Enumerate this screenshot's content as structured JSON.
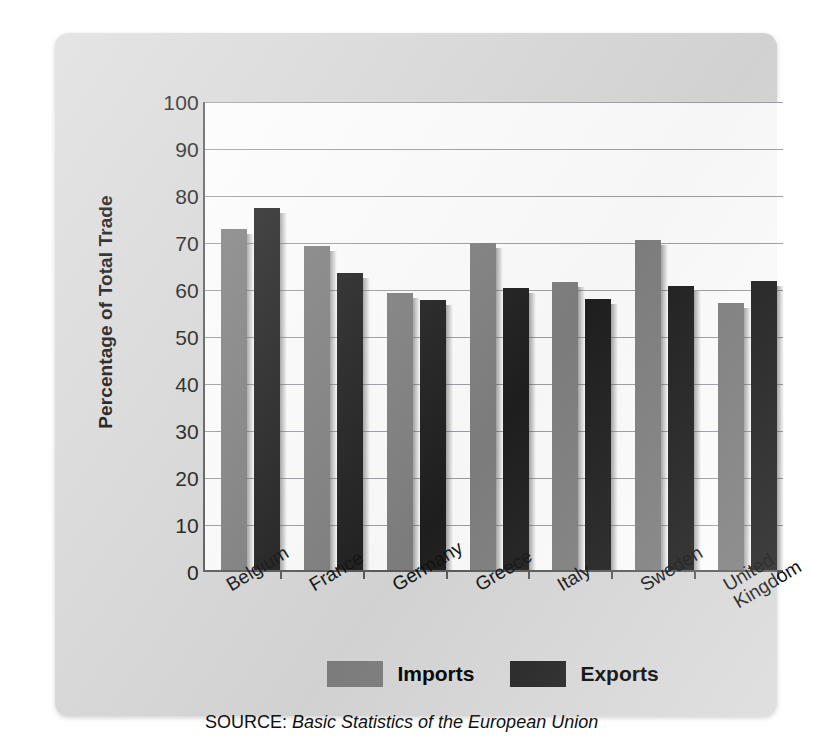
{
  "chart_data": {
    "type": "bar",
    "title": "",
    "xlabel": "",
    "ylabel": "Percentage of Total Trade",
    "ylim": [
      0,
      100
    ],
    "ytick_values": [
      100,
      90,
      80,
      70,
      60,
      50,
      40,
      30,
      20,
      10,
      0
    ],
    "grid": true,
    "legend_position": "bottom",
    "categories": [
      "Belgium",
      "France",
      "Germany",
      "Greece",
      "Italy",
      "Sweden",
      "United\nKingdom"
    ],
    "series": [
      {
        "name": "Imports",
        "color": "#808080",
        "values": [
          72.5,
          69.0,
          59.0,
          69.5,
          61.2,
          70.2,
          56.9
        ]
      },
      {
        "name": "Exports",
        "color": "#1f1f1f",
        "values": [
          77.0,
          63.3,
          57.5,
          60.0,
          57.7,
          60.5,
          61.5
        ]
      }
    ],
    "source": {
      "prefix": "SOURCE:",
      "citation": "Basic Statistics of the European Union"
    }
  },
  "legend": {
    "items": [
      {
        "label": "Imports",
        "swatch": "imports"
      },
      {
        "label": "Exports",
        "swatch": "exports"
      }
    ]
  }
}
